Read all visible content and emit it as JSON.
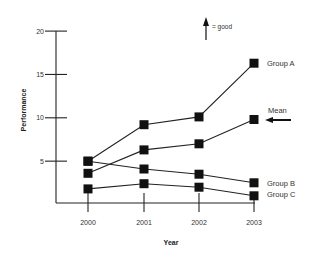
{
  "chart_data": {
    "type": "line",
    "title": "",
    "xlabel": "Year",
    "ylabel": "Performance",
    "x": [
      "2000",
      "2001",
      "2002",
      "2003"
    ],
    "yticks": [
      "5",
      "10",
      "15",
      "20"
    ],
    "ylim": [
      0,
      20
    ],
    "grid": false,
    "series": [
      {
        "name": "Group A",
        "values": [
          5.0,
          9.2,
          10.1,
          16.3
        ]
      },
      {
        "name": "Mean",
        "values": [
          3.6,
          6.3,
          7.0,
          9.8
        ]
      },
      {
        "name": "Group B",
        "values": [
          5.0,
          4.1,
          3.5,
          2.5
        ]
      },
      {
        "name": "Group C",
        "values": [
          1.8,
          2.4,
          2.0,
          1.0
        ]
      }
    ],
    "annotations": [
      {
        "text": "= good",
        "type": "up-arrow-legend"
      },
      {
        "text": "Mean",
        "type": "left-arrow-pointer"
      }
    ],
    "legend_position": "inline-right"
  },
  "labels": {
    "xlabel": "Year",
    "ylabel": "Performance",
    "good_note": "= good",
    "mean_pointer": "Mean",
    "series_a": "Group A",
    "series_b": "Group B",
    "series_c": "Group C"
  }
}
